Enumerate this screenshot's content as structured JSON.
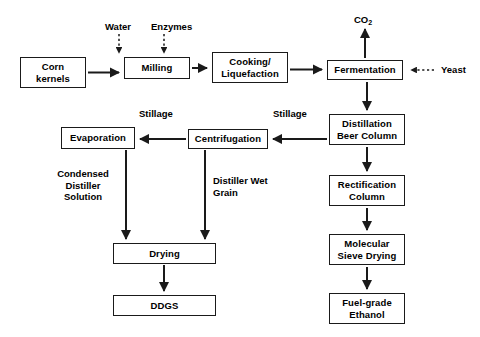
{
  "diagram": {
    "background_color": "#ffffff",
    "line_color": "#1a1a1a",
    "text_color": "#000000",
    "nodes": [
      {
        "id": "corn-kernels",
        "label_lines": [
          "Corn",
          "kernels"
        ],
        "x": 20,
        "y": 57,
        "w": 66,
        "h": 31
      },
      {
        "id": "milling",
        "label_lines": [
          "Milling"
        ],
        "x": 124,
        "y": 57,
        "w": 66,
        "h": 22
      },
      {
        "id": "cooking-liquefaction",
        "label_lines": [
          "Cooking/",
          "Liquefaction"
        ],
        "x": 212,
        "y": 52,
        "w": 76,
        "h": 31
      },
      {
        "id": "fermentation",
        "label_lines": [
          "Fermentation"
        ],
        "x": 327,
        "y": 60,
        "w": 76,
        "h": 20
      },
      {
        "id": "distillation-beer-column",
        "label_lines": [
          "Distillation",
          "Beer Column"
        ],
        "x": 329,
        "y": 114,
        "w": 76,
        "h": 31
      },
      {
        "id": "rectification-column",
        "label_lines": [
          "Rectification",
          "Column"
        ],
        "x": 329,
        "y": 175,
        "w": 76,
        "h": 31
      },
      {
        "id": "molecular-sieve-drying",
        "label_lines": [
          "Molecular",
          "Sieve Drying"
        ],
        "x": 329,
        "y": 234,
        "w": 76,
        "h": 31
      },
      {
        "id": "fuel-grade-ethanol",
        "label_lines": [
          "Fuel-grade",
          "Ethanol"
        ],
        "x": 329,
        "y": 293,
        "w": 76,
        "h": 31
      },
      {
        "id": "centrifugation",
        "label_lines": [
          "Centrifugation"
        ],
        "x": 188,
        "y": 129,
        "w": 80,
        "h": 20
      },
      {
        "id": "evaporation",
        "label_lines": [
          "Evaporation"
        ],
        "x": 61,
        "y": 127,
        "w": 74,
        "h": 22
      },
      {
        "id": "drying",
        "label_lines": [
          "Drying"
        ],
        "x": 113,
        "y": 243,
        "w": 103,
        "h": 21
      },
      {
        "id": "ddgs",
        "label_lines": [
          "DDGS"
        ],
        "x": 113,
        "y": 295,
        "w": 103,
        "h": 21
      }
    ],
    "input_output_labels": [
      {
        "id": "water",
        "text": "Water",
        "x": 105,
        "y": 21
      },
      {
        "id": "enzymes",
        "text": "Enzymes",
        "x": 151,
        "y": 21
      },
      {
        "id": "co2",
        "text": "CO",
        "subscript": "2",
        "x": 354,
        "y": 14
      },
      {
        "id": "yeast",
        "text": "Yeast",
        "x": 441,
        "y": 64
      }
    ],
    "edge_labels": [
      {
        "id": "stillage-left",
        "text": "Stillage",
        "x": 139,
        "y": 108
      },
      {
        "id": "stillage-right",
        "text": "Stillage",
        "x": 273,
        "y": 108
      },
      {
        "id": "condensed-distiller-solution",
        "lines": [
          "Condensed",
          "Distiller",
          "Solution"
        ],
        "x": 47,
        "y": 168
      },
      {
        "id": "distiller-wet-grain",
        "lines": [
          "Distiller",
          "Wet Grain"
        ],
        "x": 189,
        "y": 175
      }
    ],
    "flows": [
      {
        "from": "Corn kernels",
        "to": "Milling",
        "style": "solid"
      },
      {
        "from": "Water",
        "to": "Milling",
        "style": "dashed"
      },
      {
        "from": "Enzymes",
        "to": "Milling",
        "style": "dashed"
      },
      {
        "from": "Milling",
        "to": "Cooking/Liquefaction",
        "style": "solid"
      },
      {
        "from": "Cooking/Liquefaction",
        "to": "Fermentation",
        "style": "solid"
      },
      {
        "from": "Yeast",
        "to": "Fermentation",
        "style": "dashed"
      },
      {
        "from": "Fermentation",
        "to": "CO2",
        "style": "solid"
      },
      {
        "from": "Fermentation",
        "to": "Distillation Beer Column",
        "style": "solid"
      },
      {
        "from": "Distillation Beer Column",
        "to": "Centrifugation",
        "style": "solid",
        "label": "Stillage"
      },
      {
        "from": "Distillation Beer Column",
        "to": "Rectification Column",
        "style": "solid"
      },
      {
        "from": "Centrifugation",
        "to": "Evaporation",
        "style": "solid",
        "label": "Stillage"
      },
      {
        "from": "Centrifugation",
        "to": "Drying",
        "style": "solid",
        "label": "Distiller Wet Grain"
      },
      {
        "from": "Evaporation",
        "to": "Drying",
        "style": "solid",
        "label": "Condensed Distiller Solution"
      },
      {
        "from": "Rectification Column",
        "to": "Molecular Sieve Drying",
        "style": "solid"
      },
      {
        "from": "Molecular Sieve Drying",
        "to": "Fuel-grade Ethanol",
        "style": "solid"
      },
      {
        "from": "Drying",
        "to": "DDGS",
        "style": "solid"
      }
    ]
  }
}
